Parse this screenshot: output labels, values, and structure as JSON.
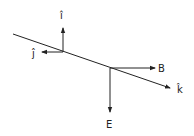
{
  "diagram": {
    "colors": {
      "stroke": "#222222",
      "background": "#ffffff"
    },
    "labels": {
      "i_hat": "î",
      "j_hat": "ĵ",
      "k_hat": "k̂",
      "B": "B",
      "E": "E"
    },
    "vectors": [
      {
        "name": "i-hat",
        "from": [
          63,
          52
        ],
        "to": [
          63,
          28
        ]
      },
      {
        "name": "j-hat",
        "from": [
          63,
          52
        ],
        "to": [
          42,
          52
        ]
      },
      {
        "name": "k-hat",
        "from": [
          13,
          34
        ],
        "to": [
          170,
          88
        ]
      },
      {
        "name": "B",
        "from": [
          110,
          68
        ],
        "to": [
          155,
          68
        ]
      },
      {
        "name": "E",
        "from": [
          110,
          68
        ],
        "to": [
          110,
          112
        ]
      }
    ]
  }
}
